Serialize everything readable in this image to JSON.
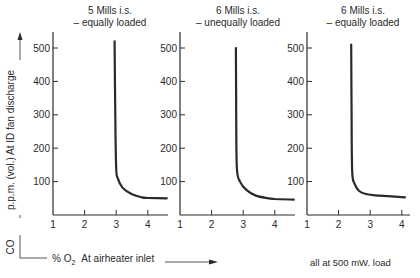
{
  "chart_data": [
    {
      "type": "line",
      "title": "5 Mills i.s. – equally loaded",
      "title_lines": [
        "5 Mills i.s.",
        "– equally loaded"
      ],
      "xlabel": "% O2 At airheater inlet",
      "ylabel": "CO p.p.m. (vol.) At ID fan discharge",
      "xlim": [
        1,
        4.6
      ],
      "ylim": [
        0,
        550
      ],
      "x_ticks": [
        "1",
        "2",
        "3",
        "4"
      ],
      "y_ticks": [
        "100",
        "200",
        "300",
        "400",
        "500"
      ],
      "grid": false,
      "series": [
        {
          "name": "CO",
          "x": [
            2.95,
            2.97,
            3.0,
            3.05,
            3.2,
            3.5,
            3.8,
            4.0,
            4.6
          ],
          "y": [
            520,
            300,
            140,
            110,
            82,
            62,
            53,
            51,
            50
          ]
        }
      ]
    },
    {
      "type": "line",
      "title": "6 Mills i.s. – unequally loaded",
      "title_lines": [
        "6 Mills i.s.",
        "– unequally loaded"
      ],
      "xlabel": "% O2 At airheater inlet",
      "ylabel": "CO p.p.m. (vol.) At ID fan discharge",
      "xlim": [
        1,
        4.6
      ],
      "ylim": [
        0,
        550
      ],
      "x_ticks": [
        "1",
        "2",
        "3",
        "4"
      ],
      "y_ticks": [
        "100",
        "200",
        "300",
        "400",
        "500"
      ],
      "grid": false,
      "series": [
        {
          "name": "CO",
          "x": [
            2.77,
            2.78,
            2.8,
            2.9,
            3.1,
            3.4,
            3.8,
            4.0,
            4.6
          ],
          "y": [
            500,
            300,
            140,
            100,
            75,
            58,
            50,
            48,
            46
          ]
        }
      ]
    },
    {
      "type": "line",
      "title": "6 Mills i.s. – equally loaded",
      "title_lines": [
        "6 Mills i.s.",
        "– equally loaded"
      ],
      "xlabel": "% O2 At airheater inlet",
      "ylabel": "CO p.p.m. (vol.) At ID fan discharge",
      "xlim": [
        1,
        4.2
      ],
      "ylim": [
        0,
        550
      ],
      "x_ticks": [
        "1",
        "2",
        "3",
        "4"
      ],
      "y_ticks": [
        "100",
        "200",
        "300",
        "400",
        "500"
      ],
      "grid": false,
      "series": [
        {
          "name": "CO",
          "x": [
            2.4,
            2.41,
            2.43,
            2.5,
            2.65,
            2.9,
            3.3,
            4.1
          ],
          "y": [
            510,
            300,
            130,
            95,
            72,
            62,
            58,
            53
          ]
        }
      ]
    }
  ],
  "labels": {
    "y_axis_co": "CO",
    "y_axis_text": "p.p.m. (vol.)  At ID fan discharge",
    "x_axis_text_prefix": "% O",
    "x_axis_text_sub": "2",
    "x_axis_text_suffix": "At airheater inlet",
    "footnote": "all at 500 mW. load"
  },
  "colors": {
    "ink": "#2a2a2a",
    "background": "#ffffff"
  }
}
